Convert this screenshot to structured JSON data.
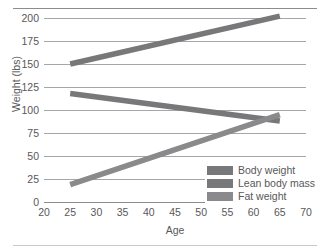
{
  "chart_data": {
    "type": "line",
    "title": "",
    "xlabel": "Age",
    "ylabel": "Weight (lbs)",
    "xlim": [
      20,
      70
    ],
    "ylim": [
      0,
      200
    ],
    "xticks": [
      20,
      25,
      30,
      35,
      40,
      45,
      50,
      55,
      60,
      65,
      70
    ],
    "yticks": [
      0,
      25,
      50,
      75,
      100,
      125,
      150,
      175,
      200
    ],
    "grid": "horizontal",
    "legend_position": "lower-right-inside",
    "x": [
      25,
      65
    ],
    "series": [
      {
        "name": "Body weight",
        "values": [
          150,
          202
        ],
        "color": "#78787a"
      },
      {
        "name": "Lean body mass",
        "values": [
          118,
          88
        ],
        "color": "#78787a"
      },
      {
        "name": "Fat weight",
        "values": [
          19,
          95
        ],
        "color": "#8a8a8c"
      }
    ]
  },
  "axes": {
    "y_label": "Weight (lbs)",
    "x_label": "Age",
    "y_tick_labels": [
      "0",
      "25",
      "50",
      "75",
      "100",
      "125",
      "150",
      "175",
      "200"
    ],
    "x_tick_labels": [
      "20",
      "25",
      "30",
      "35",
      "40",
      "45",
      "50",
      "55",
      "60",
      "65",
      "70"
    ]
  },
  "legend": {
    "items": [
      {
        "label": "Body weight",
        "color": "#78787a"
      },
      {
        "label": "Lean body mass",
        "color": "#78787a"
      },
      {
        "label": "Fat weight",
        "color": "#8a8a8c"
      }
    ]
  },
  "colors": {
    "gridline": "#a6a6a8",
    "axis": "#8d8d8f",
    "text": "#58585a",
    "background": "#ffffff"
  }
}
